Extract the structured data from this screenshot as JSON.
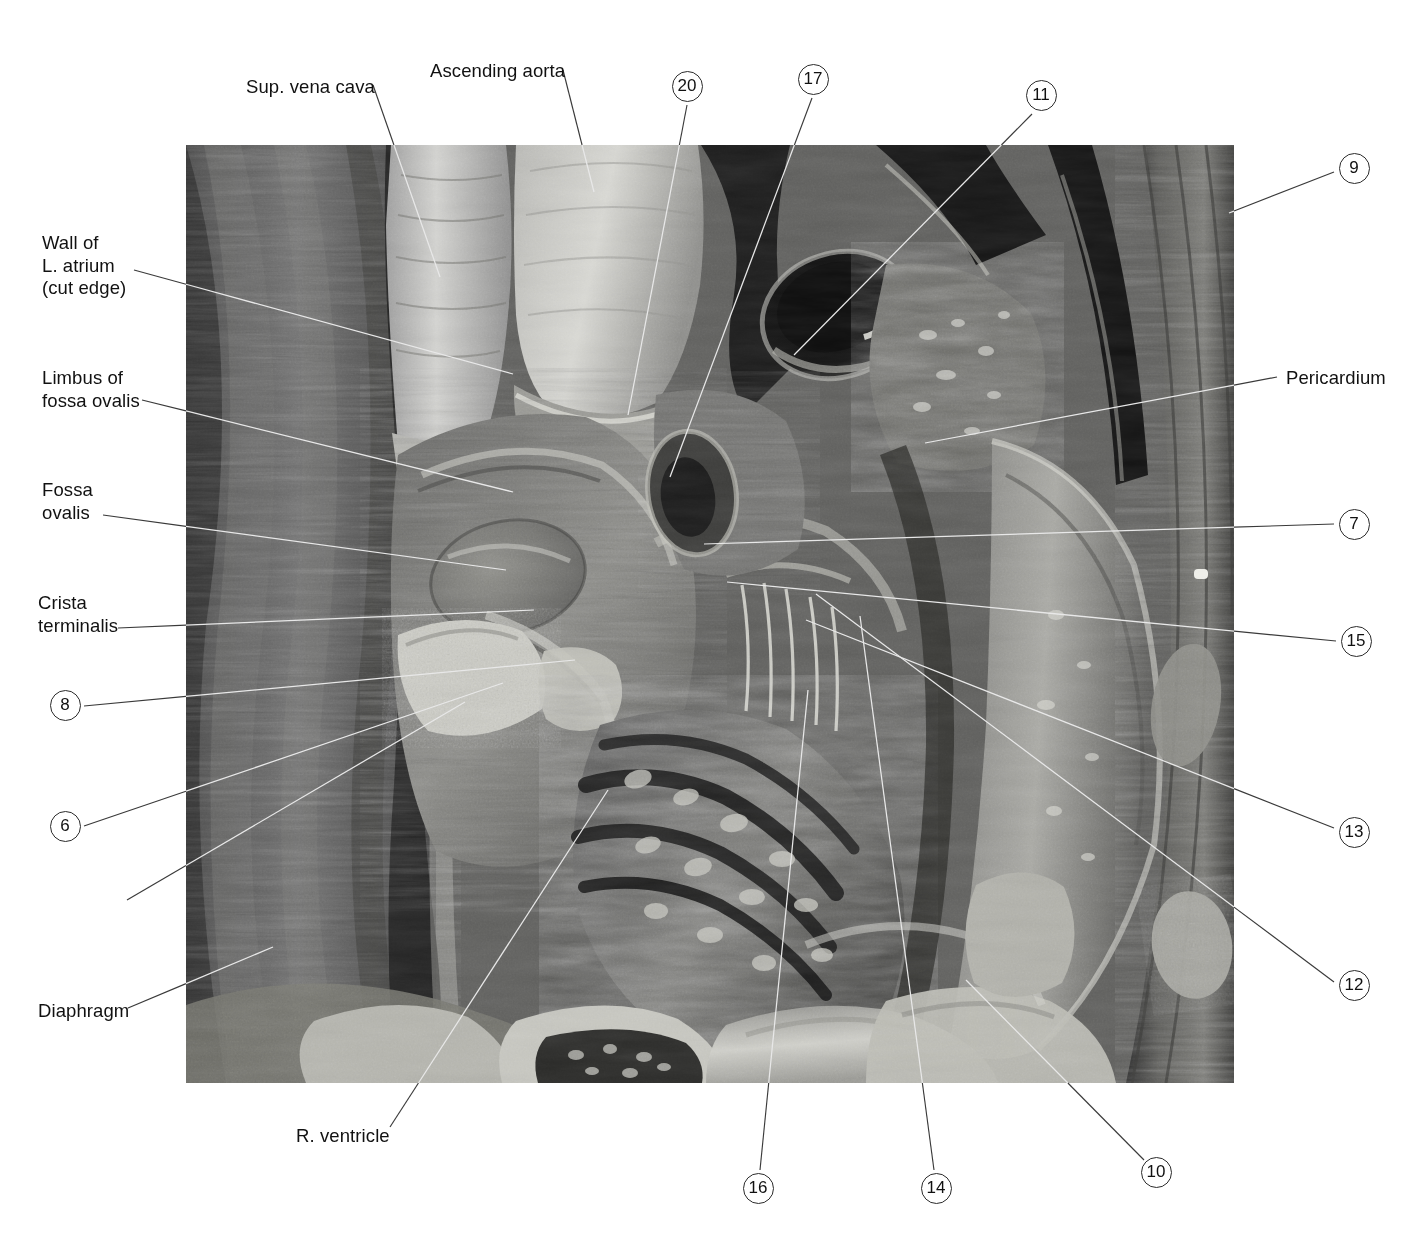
{
  "plate": {
    "title": "Dissection of the right atrium and right ventricle",
    "photo": {
      "name": "anatomical-dissection-photograph",
      "kind": "grayscale-photograph",
      "left": 186,
      "top": 145,
      "width": 1048,
      "height": 938
    }
  },
  "labels": [
    {
      "id": "sup-vena-cava",
      "text": "Sup. vena cava",
      "x": 246,
      "y": 76,
      "align": "left",
      "lines": [
        "Sup. vena cava"
      ]
    },
    {
      "id": "ascending-aorta",
      "text": "Ascending aorta",
      "x": 430,
      "y": 60,
      "align": "left",
      "lines": [
        "Ascending aorta"
      ]
    },
    {
      "id": "wall-of-l-atrium",
      "text": "Wall of L. atrium (cut edge)",
      "x": 42,
      "y": 232,
      "align": "left",
      "lines": [
        "Wall of",
        "L. atrium",
        "(cut edge)"
      ]
    },
    {
      "id": "limbus-fossa-ovalis",
      "text": "Limbus of fossa ovalis",
      "x": 42,
      "y": 367,
      "align": "left",
      "lines": [
        "Limbus of",
        "fossa ovalis"
      ]
    },
    {
      "id": "fossa-ovalis",
      "text": "Fossa ovalis",
      "x": 42,
      "y": 479,
      "align": "left",
      "lines": [
        "Fossa",
        "ovalis"
      ]
    },
    {
      "id": "crista-terminalis",
      "text": "Crista terminalis",
      "x": 38,
      "y": 592,
      "align": "left",
      "lines": [
        "Crista",
        "terminalis"
      ]
    },
    {
      "id": "valve-inf-vena-cava",
      "text": "Valve of inf. vena cava",
      "x": 33,
      "y": 896,
      "align": "left",
      "lines": [
        "Valve of inf.",
        "vena cava"
      ]
    },
    {
      "id": "diaphragm",
      "text": "Diaphragm",
      "x": 38,
      "y": 1000,
      "align": "left",
      "lines": [
        "Diaphragm"
      ]
    },
    {
      "id": "r-ventricle",
      "text": "R. ventricle",
      "x": 296,
      "y": 1125,
      "align": "left",
      "lines": [
        "R. ventricle"
      ]
    },
    {
      "id": "pericardium",
      "text": "Pericardium",
      "x": 1286,
      "y": 367,
      "align": "left",
      "lines": [
        "Pericardium"
      ]
    }
  ],
  "numbered_callouts": [
    {
      "id": "callout-20",
      "number": "20",
      "cx": 687,
      "cy": 86
    },
    {
      "id": "callout-17",
      "number": "17",
      "cx": 813,
      "cy": 79
    },
    {
      "id": "callout-11",
      "number": "11",
      "cx": 1041,
      "cy": 95
    },
    {
      "id": "callout-9",
      "number": "9",
      "cx": 1354,
      "cy": 168
    },
    {
      "id": "callout-7",
      "number": "7",
      "cx": 1354,
      "cy": 524
    },
    {
      "id": "callout-15",
      "number": "15",
      "cx": 1356,
      "cy": 641
    },
    {
      "id": "callout-13",
      "number": "13",
      "cx": 1354,
      "cy": 832
    },
    {
      "id": "callout-12",
      "number": "12",
      "cx": 1354,
      "cy": 985
    },
    {
      "id": "callout-8",
      "number": "8",
      "cx": 65,
      "cy": 705
    },
    {
      "id": "callout-6",
      "number": "6",
      "cx": 65,
      "cy": 826
    },
    {
      "id": "callout-16",
      "number": "16",
      "cx": 758,
      "cy": 1188
    },
    {
      "id": "callout-14",
      "number": "14",
      "cx": 936,
      "cy": 1188
    },
    {
      "id": "callout-10",
      "number": "10",
      "cx": 1156,
      "cy": 1172
    }
  ],
  "leader_lines": [
    {
      "id": "leader-sup-vena-cava",
      "x1": 373,
      "y1": 85,
      "x2": 440,
      "y2": 277
    },
    {
      "id": "leader-ascending-aorta",
      "x1": 563,
      "y1": 70,
      "x2": 594,
      "y2": 192
    },
    {
      "id": "leader-wall-l-atrium",
      "x1": 134,
      "y1": 270,
      "x2": 513,
      "y2": 374
    },
    {
      "id": "leader-limbus",
      "x1": 142,
      "y1": 400,
      "x2": 513,
      "y2": 492
    },
    {
      "id": "leader-fossa-ovalis",
      "x1": 103,
      "y1": 515,
      "x2": 506,
      "y2": 570
    },
    {
      "id": "leader-crista",
      "x1": 118,
      "y1": 628,
      "x2": 534,
      "y2": 610
    },
    {
      "id": "leader-8",
      "x1": 84,
      "y1": 706,
      "x2": 575,
      "y2": 660
    },
    {
      "id": "leader-6",
      "x1": 84,
      "y1": 826,
      "x2": 503,
      "y2": 683
    },
    {
      "id": "leader-valve-ivc",
      "x1": 127,
      "y1": 900,
      "x2": 465,
      "y2": 702
    },
    {
      "id": "leader-diaphragm",
      "x1": 128,
      "y1": 1008,
      "x2": 273,
      "y2": 947
    },
    {
      "id": "leader-r-ventricle",
      "x1": 390,
      "y1": 1127,
      "x2": 608,
      "y2": 790
    },
    {
      "id": "leader-20",
      "x1": 687,
      "y1": 105,
      "x2": 628,
      "y2": 415
    },
    {
      "id": "leader-17",
      "x1": 812,
      "y1": 98,
      "x2": 670,
      "y2": 477
    },
    {
      "id": "leader-11",
      "x1": 1032,
      "y1": 114,
      "x2": 794,
      "y2": 355
    },
    {
      "id": "leader-9",
      "x1": 1334,
      "y1": 172,
      "x2": 1229,
      "y2": 213
    },
    {
      "id": "leader-pericardium",
      "x1": 1277,
      "y1": 377,
      "x2": 925,
      "y2": 443
    },
    {
      "id": "leader-7",
      "x1": 1334,
      "y1": 524,
      "x2": 704,
      "y2": 544
    },
    {
      "id": "leader-15",
      "x1": 1336,
      "y1": 641,
      "x2": 727,
      "y2": 582
    },
    {
      "id": "leader-13",
      "x1": 1334,
      "y1": 828,
      "x2": 806,
      "y2": 620
    },
    {
      "id": "leader-12",
      "x1": 1334,
      "y1": 982,
      "x2": 816,
      "y2": 594
    },
    {
      "id": "leader-16",
      "x1": 760,
      "y1": 1170,
      "x2": 808,
      "y2": 690
    },
    {
      "id": "leader-14",
      "x1": 934,
      "y1": 1170,
      "x2": 860,
      "y2": 616
    },
    {
      "id": "leader-10",
      "x1": 1144,
      "y1": 1160,
      "x2": 966,
      "y2": 980
    }
  ],
  "colors": {
    "page_background": "#ffffff",
    "text": "#111111",
    "leader_line": "#3a3a3a",
    "leader_line_on_photo": "#e8e8e8",
    "circle_stroke": "#2b2b2b"
  }
}
